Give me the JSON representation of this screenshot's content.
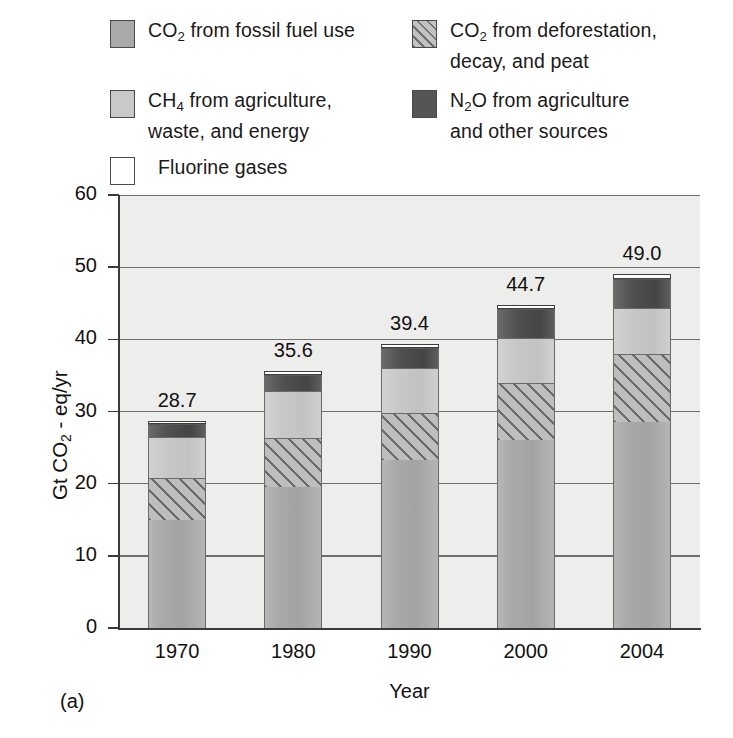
{
  "figure": {
    "caption": "(a)",
    "panel_label": "(a)"
  },
  "legend": {
    "items": [
      {
        "id": "co2-fossil",
        "swatch": "solid-medium-gray",
        "label_pre": "CO",
        "label_sub": "2",
        "label_post": " from fossil fuel use"
      },
      {
        "id": "co2-defor",
        "swatch": "diagonal-hatch",
        "label_pre": "CO",
        "label_sub": "2",
        "label_post": " from deforestation,\ndecay, and peat"
      },
      {
        "id": "ch4",
        "swatch": "solid-light-gray",
        "label_pre": "CH",
        "label_sub": "4",
        "label_post": " from agriculture,\nwaste, and energy"
      },
      {
        "id": "n2o",
        "swatch": "solid-dark-gray",
        "label_pre": "N",
        "label_sub": "2",
        "label_post": "O from agriculture\nand other sources"
      },
      {
        "id": "fluorine",
        "swatch": "white-outline",
        "label_pre": "",
        "label_sub": "",
        "label_post": "Fluorine gases"
      }
    ]
  },
  "chart_data": {
    "type": "bar",
    "subtype": "stacked",
    "title": "",
    "xlabel": "Year",
    "ylabel": "Gt CO2 - eq/yr",
    "ylabel_parts": {
      "pre": "Gt CO",
      "sub": "2",
      "post": " - eq/yr"
    },
    "categories": [
      "1970",
      "1980",
      "1990",
      "2000",
      "2004"
    ],
    "ylim": [
      0,
      60
    ],
    "yticks": [
      0,
      10,
      20,
      30,
      40,
      50,
      60
    ],
    "grid": true,
    "legend_position": "above-plot",
    "totals": [
      28.7,
      35.6,
      39.4,
      44.7,
      49.0
    ],
    "total_labels": [
      "28.7",
      "35.6",
      "39.4",
      "44.7",
      "49.0"
    ],
    "series": [
      {
        "name": "CO2 from fossil fuel use",
        "key": "co2-fossil",
        "values": [
          15.0,
          19.5,
          23.3,
          26.0,
          28.5
        ]
      },
      {
        "name": "CO2 from deforestation, decay, peat",
        "key": "co2-defor",
        "values": [
          5.8,
          6.8,
          6.5,
          8.0,
          9.5
        ]
      },
      {
        "name": "CH4 from agriculture, waste, energy",
        "key": "ch4",
        "values": [
          5.7,
          6.5,
          6.2,
          6.2,
          6.4
        ]
      },
      {
        "name": "N2O from agriculture, other sources",
        "key": "n2o",
        "values": [
          1.8,
          2.3,
          2.8,
          4.0,
          3.9
        ]
      },
      {
        "name": "Fluorine gases",
        "key": "fluorine",
        "values": [
          0.4,
          0.5,
          0.6,
          0.5,
          0.7
        ]
      }
    ]
  },
  "colors": {
    "co2_fossil": "#a9a9a9",
    "co2_defor": "#bebebe",
    "ch4": "#c8c8c8",
    "n2o": "#4f4f4f",
    "fluorine": "#ffffff",
    "plot_background": "#ededec",
    "gridline": "#6e6e6e",
    "axis": "#3a3a3a"
  }
}
